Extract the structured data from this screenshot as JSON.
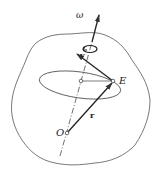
{
  "diagram": {
    "labels": {
      "omega": "ω",
      "v": "v",
      "E": "E",
      "O": "O",
      "r": "r"
    },
    "colors": {
      "stroke": "#333333",
      "body_outline": "#555555",
      "background": "#ffffff"
    },
    "elements": [
      "rigid-body-outline",
      "rotation-axis",
      "angular-velocity-vector",
      "rotation-direction-arc",
      "circular-path-ellipse",
      "position-vector-r",
      "velocity-vector-v",
      "point-E",
      "point-O",
      "path-center-point"
    ]
  }
}
